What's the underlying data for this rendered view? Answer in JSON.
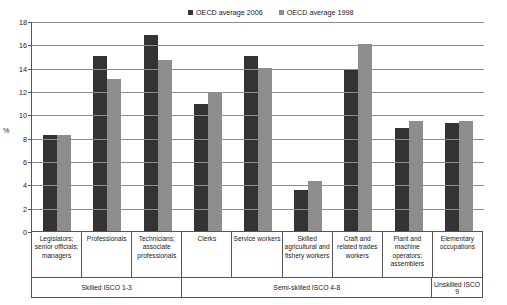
{
  "chart_data": {
    "type": "bar",
    "title": "",
    "xlabel": "",
    "ylabel": "%",
    "ylim": [
      0,
      18
    ],
    "yticks": [
      0,
      2,
      4,
      6,
      8,
      10,
      12,
      14,
      16,
      18
    ],
    "grid": true,
    "legend_position": "top-right",
    "categories": [
      "Legislators; senior officials; managers",
      "Professionals",
      "Technicians; associate professionals",
      "Clerks",
      "Service workers",
      "Skilled agricultural and fishery workers",
      "Craft and related trades workers",
      "Plant and machine operators; assemblers",
      "Elementary occupations"
    ],
    "series": [
      {
        "name": "OECD average 2006",
        "color": "#333333",
        "values": [
          8.2,
          15.0,
          16.8,
          10.9,
          15.0,
          3.5,
          13.9,
          8.8,
          9.3
        ]
      },
      {
        "name": "OECD average 1998",
        "color": "#8d8d8d",
        "values": [
          8.2,
          13.0,
          14.7,
          11.9,
          14.0,
          4.3,
          16.0,
          9.4,
          9.4
        ]
      }
    ],
    "groups": [
      {
        "label": "Skilled ISCO 1-3",
        "span": 3
      },
      {
        "label": "Semi-skilled ISCO 4-8",
        "span": 5
      },
      {
        "label": "Unskilled ISCO 9",
        "span": 1
      }
    ]
  }
}
